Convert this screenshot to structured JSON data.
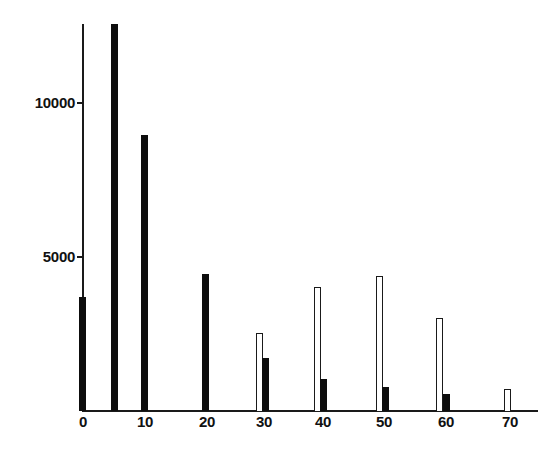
{
  "chart_data": {
    "type": "bar",
    "title": "",
    "xlabel": "",
    "ylabel": "",
    "ylim": [
      0,
      12600
    ],
    "xlim": [
      0,
      75
    ],
    "grid": false,
    "legend": null,
    "x_ticks": [
      "0",
      "10",
      "20",
      "30",
      "40",
      "50",
      "60",
      "70"
    ],
    "y_ticks": [
      "5000",
      "10000"
    ],
    "series": [
      {
        "name": "filled",
        "style": "solid black",
        "x": [
          0,
          5,
          10,
          20,
          30,
          40,
          50,
          60
        ],
        "values": [
          3700,
          12500,
          9000,
          4450,
          1720,
          1040,
          780,
          550
        ]
      },
      {
        "name": "open",
        "style": "white with black outline",
        "x": [
          30,
          40,
          50,
          60,
          70
        ],
        "values": [
          2530,
          4030,
          4380,
          3020,
          710
        ]
      }
    ]
  },
  "axes": {
    "y_labels": [
      {
        "text": "10000",
        "y": 103
      },
      {
        "text": "5000",
        "y": 257
      }
    ],
    "x_labels": [
      {
        "text": "0",
        "x": 83
      },
      {
        "text": "10",
        "x": 145
      },
      {
        "text": "20",
        "x": 207
      },
      {
        "text": "30",
        "x": 264
      },
      {
        "text": "40",
        "x": 323
      },
      {
        "text": "50",
        "x": 384
      },
      {
        "text": "60",
        "x": 446
      },
      {
        "text": "70",
        "x": 510
      }
    ]
  },
  "bars": [
    {
      "series": "filled",
      "x": 0,
      "left": 79,
      "width": 7,
      "top": 297
    },
    {
      "series": "filled",
      "x": 5,
      "left": 111,
      "width": 7,
      "top": 24
    },
    {
      "series": "filled",
      "x": 10,
      "left": 141,
      "width": 7,
      "top": 135
    },
    {
      "series": "filled",
      "x": 20,
      "left": 202,
      "width": 7,
      "top": 274
    },
    {
      "series": "open",
      "x": 30,
      "left": 256,
      "width": 7,
      "top": 333
    },
    {
      "series": "filled",
      "x": 30,
      "left": 262,
      "width": 7,
      "top": 358
    },
    {
      "series": "open",
      "x": 40,
      "left": 314,
      "width": 7,
      "top": 287
    },
    {
      "series": "filled",
      "x": 40,
      "left": 320,
      "width": 7,
      "top": 379
    },
    {
      "series": "open",
      "x": 50,
      "left": 376,
      "width": 7,
      "top": 276
    },
    {
      "series": "filled",
      "x": 50,
      "left": 382,
      "width": 7,
      "top": 387
    },
    {
      "series": "open",
      "x": 60,
      "left": 436,
      "width": 7,
      "top": 318
    },
    {
      "series": "filled",
      "x": 60,
      "left": 443,
      "width": 7,
      "top": 394
    },
    {
      "series": "open",
      "x": 70,
      "left": 504,
      "width": 7,
      "top": 389
    }
  ]
}
